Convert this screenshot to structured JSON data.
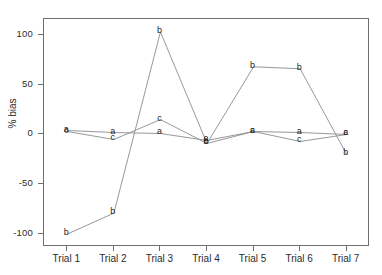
{
  "chart_data": {
    "type": "line",
    "title": "",
    "subtitle": "",
    "xlabel": "",
    "ylabel": "% bias",
    "categories": [
      "Trial 1",
      "Trial 2",
      "Trial 3",
      "Trial 4",
      "Trial 5",
      "Trial 6",
      "Trial 7"
    ],
    "x": [
      1,
      2,
      3,
      4,
      5,
      6,
      7
    ],
    "series": [
      {
        "name": "a",
        "label": "a",
        "values": [
          4,
          2,
          1,
          -6,
          3,
          2,
          0
        ]
      },
      {
        "name": "b",
        "label": "b",
        "values": [
          -100,
          -79,
          103,
          -9,
          68,
          66,
          -20
        ]
      },
      {
        "name": "c",
        "label": "c",
        "values": [
          3,
          -5,
          15,
          -9,
          3,
          -7,
          0
        ]
      }
    ],
    "point_labels": [
      "a",
      "b",
      "c"
    ],
    "ylim": [
      -113,
      116
    ],
    "xlim": [
      0.5,
      7.5
    ],
    "yticks": [
      -100,
      -50,
      0,
      50,
      100
    ],
    "ytick_labels": [
      "-100",
      "-50",
      "0",
      "50",
      "100"
    ],
    "grid": false,
    "legend": "none",
    "marker_style": "text-letter",
    "line_color": "#8c8c8c",
    "text_color": "#1f1f1f",
    "axis_color": "#6e6e6e"
  },
  "axes": {
    "y_title": "% bias",
    "y_tick_labels": [
      "100",
      "50",
      "0",
      "-50",
      "-100"
    ],
    "x_tick_labels": [
      "Trial 1",
      "Trial 2",
      "Trial 3",
      "Trial 4",
      "Trial 5",
      "Trial 6",
      "Trial 7"
    ]
  }
}
